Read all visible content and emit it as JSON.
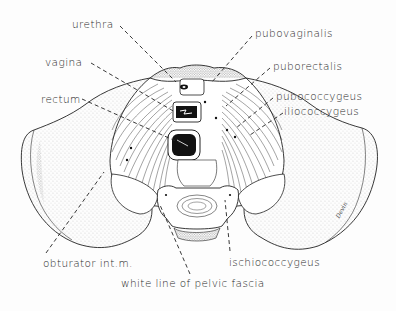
{
  "diagram": {
    "ink_color": "#222222",
    "stipple_color": "#555555",
    "background_color": "#fdfdfd",
    "labels": [
      {
        "id": "urethra",
        "text": "urethra",
        "x": 72,
        "y": 19,
        "points_to": [
          176,
          82
        ]
      },
      {
        "id": "vagina",
        "text": "vagina",
        "x": 45,
        "y": 57,
        "points_to": [
          175,
          112
        ]
      },
      {
        "id": "rectum",
        "text": "rectum",
        "x": 41,
        "y": 94,
        "points_to": [
          180,
          143
        ]
      },
      {
        "id": "pubovaginalis",
        "text": "pubovaginalis",
        "x": 255,
        "y": 28,
        "points_to": [
          212,
          82
        ]
      },
      {
        "id": "puborectalis",
        "text": "puborectalis",
        "x": 273,
        "y": 61,
        "points_to": [
          226,
          106
        ]
      },
      {
        "id": "pubococcygeus",
        "text": "pubococcygeus",
        "x": 276,
        "y": 91,
        "points_to": [
          236,
          128
        ]
      },
      {
        "id": "iliococcygeus",
        "text": "iliococcygeus",
        "x": 284,
        "y": 106,
        "points_to": [
          250,
          135
        ]
      },
      {
        "id": "obturator",
        "text": "obturator int.m.",
        "x": 43,
        "y": 258,
        "points_to": [
          104,
          172
        ]
      },
      {
        "id": "ischiococcygeus",
        "text": "ischiococcygeus",
        "x": 229,
        "y": 257,
        "points_to": [
          225,
          200
        ]
      },
      {
        "id": "white_line",
        "text": "white line of pelvic fascia",
        "x": 121,
        "y": 278,
        "points_to": [
          160,
          205
        ]
      }
    ],
    "signature": "Devin"
  }
}
